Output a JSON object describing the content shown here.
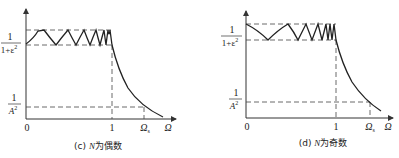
{
  "figures": [
    {
      "id": "c",
      "caption": "(c) N为偶数",
      "caption_prefix": "(c) ",
      "caption_var": "N",
      "caption_suffix": "为偶数",
      "y_labels": {
        "passband_num": "1",
        "passband_den": "1+ε",
        "passband_den_exp": "2",
        "stopband_num": "1",
        "stopband_den": "A",
        "stopband_den_exp": "2"
      },
      "x_labels": {
        "origin": "0",
        "cutoff": "1",
        "stop": "Ω",
        "stop_sub": "s",
        "axis": "Ω"
      },
      "start_value": "1/(1+ε²)"
    },
    {
      "id": "d",
      "caption": "(d) N为奇数",
      "caption_prefix": "(d) ",
      "caption_var": "N",
      "caption_suffix": "为奇数",
      "y_labels": {
        "passband_num": "1",
        "passband_den": "1+ε",
        "passband_den_exp": "2",
        "stopband_num": "1",
        "stopband_den": "A",
        "stopband_den_exp": "2"
      },
      "x_labels": {
        "origin": "0",
        "cutoff": "1",
        "stop": "Ω",
        "stop_sub": "s",
        "axis": "Ω"
      },
      "start_value": "1"
    }
  ]
}
